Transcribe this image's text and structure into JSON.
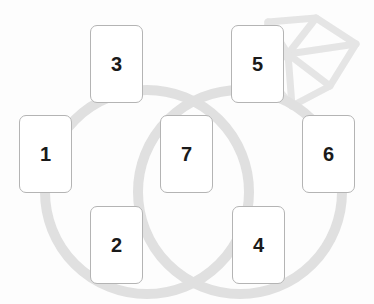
{
  "canvas": {
    "width": 374,
    "height": 304,
    "background_color": "#fdfdfd"
  },
  "watermark": {
    "name": "diamond-gem-outline",
    "color": "#e6e6e6",
    "stroke_color": "#e2e2e2",
    "stroke_width": 7
  },
  "venn": {
    "stroke_color": "#e0e0e0",
    "stroke_width": 10,
    "circles": [
      {
        "name": "left-circle",
        "cx": 147,
        "cy": 192,
        "r": 102
      },
      {
        "name": "right-circle",
        "cx": 240,
        "cy": 192,
        "r": 102
      }
    ]
  },
  "cards": [
    {
      "id": "card-1",
      "label": "1",
      "x": 19,
      "y": 115,
      "w": 53,
      "h": 78
    },
    {
      "id": "card-3",
      "label": "3",
      "x": 90,
      "y": 25,
      "w": 53,
      "h": 78
    },
    {
      "id": "card-5",
      "label": "5",
      "x": 231,
      "y": 25,
      "w": 53,
      "h": 78
    },
    {
      "id": "card-7",
      "label": "7",
      "x": 160,
      "y": 115,
      "w": 53,
      "h": 78
    },
    {
      "id": "card-6",
      "label": "6",
      "x": 302,
      "y": 115,
      "w": 53,
      "h": 78
    },
    {
      "id": "card-2",
      "label": "2",
      "x": 90,
      "y": 206,
      "w": 53,
      "h": 78
    },
    {
      "id": "card-4",
      "label": "4",
      "x": 232,
      "y": 206,
      "w": 53,
      "h": 78
    }
  ],
  "colors": {
    "card_fill": "#ffffff",
    "card_border": "#b4b4b4",
    "card_text": "#1a1a1a",
    "circle_gray": "#e0e0e0",
    "watermark_gray": "#e6e6e6"
  }
}
